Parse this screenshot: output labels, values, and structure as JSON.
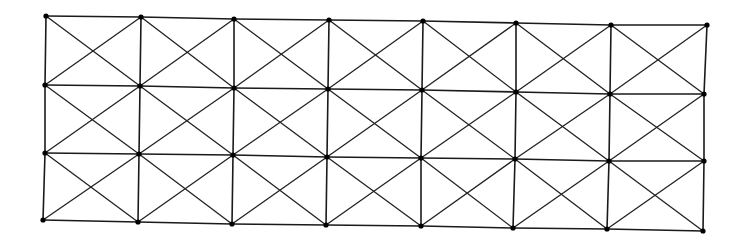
{
  "diagram": {
    "type": "cross-braced truss grid",
    "columns": 8,
    "rows": 4,
    "stroke_color": "#1a1a1a",
    "node_color": "#000000",
    "background": "#ffffff",
    "node_radius": 2.6,
    "nodes": [
      [
        [
          46,
          16
        ],
        [
          141,
          17
        ],
        [
          234,
          19
        ],
        [
          329,
          20
        ],
        [
          423,
          21
        ],
        [
          516,
          23
        ],
        [
          611,
          25
        ],
        [
          707,
          25
        ]
      ],
      [
        [
          45,
          85
        ],
        [
          140,
          86
        ],
        [
          234,
          88
        ],
        [
          328,
          89
        ],
        [
          422,
          90
        ],
        [
          516,
          92
        ],
        [
          610,
          94
        ],
        [
          704,
          94
        ]
      ],
      [
        [
          45,
          153
        ],
        [
          139,
          154
        ],
        [
          233,
          155
        ],
        [
          327,
          157
        ],
        [
          421,
          158
        ],
        [
          515,
          159
        ],
        [
          609,
          161
        ],
        [
          704,
          161
        ]
      ],
      [
        [
          43,
          220
        ],
        [
          138,
          222
        ],
        [
          232,
          224
        ],
        [
          326,
          225
        ],
        [
          421,
          226
        ],
        [
          513,
          228
        ],
        [
          607,
          229
        ],
        [
          703,
          231
        ]
      ]
    ],
    "cell_bracing": "X-cross in every panel"
  }
}
